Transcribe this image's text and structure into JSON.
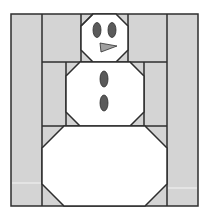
{
  "pattern": {
    "subject": "snowman quilt block",
    "colors": {
      "background_fabric": "#d4d4d4",
      "snow_fabric": "#ffffff",
      "seam_line": "#2e2e2e",
      "eyes_buttons": "#5a5a5a",
      "nose": "#a0a0a0",
      "page": "#ffffff"
    },
    "pieces": {
      "head": {
        "label": "head"
      },
      "body": {
        "label": "middle body",
        "buttons": 2
      },
      "base": {
        "label": "bottom body"
      },
      "face": {
        "eyes": 2,
        "nose": "triangle"
      }
    }
  }
}
